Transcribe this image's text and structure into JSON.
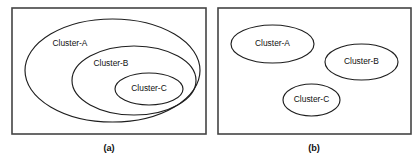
{
  "figure": {
    "background_color": "#ffffff",
    "frame_color": "#444444",
    "ellipse_color": "#1e1e1e",
    "text_color": "#111111",
    "panels": [
      {
        "id": "panel-a",
        "caption": "(a)",
        "caption_x": 109,
        "caption_y": 149,
        "frame": {
          "x": 12,
          "y": 8,
          "width": 194,
          "height": 126
        },
        "clusters": [
          {
            "label": "Cluster-A",
            "cx": 112.5,
            "cy": 70.5,
            "rx": 87.5,
            "ry": 51.5,
            "label_x": 70,
            "label_y": 44
          },
          {
            "label": "Cluster-B",
            "cx": 134,
            "cy": 80.5,
            "rx": 62,
            "ry": 34.5,
            "label_x": 111,
            "label_y": 64
          },
          {
            "label": "Cluster-C",
            "cx": 149,
            "cy": 89,
            "rx": 34,
            "ry": 16,
            "label_x": 149,
            "label_y": 89
          }
        ]
      },
      {
        "id": "panel-b",
        "caption": "(b)",
        "caption_x": 314,
        "caption_y": 149,
        "frame": {
          "x": 218,
          "y": 8,
          "width": 193,
          "height": 126
        },
        "clusters": [
          {
            "label": "Cluster-A",
            "cx": 272.5,
            "cy": 44,
            "rx": 41.5,
            "ry": 19,
            "label_x": 272.5,
            "label_y": 44
          },
          {
            "label": "Cluster-B",
            "cx": 361.5,
            "cy": 62,
            "rx": 36.5,
            "ry": 18,
            "label_x": 361.5,
            "label_y": 62
          },
          {
            "label": "Cluster-C",
            "cx": 311.5,
            "cy": 100,
            "rx": 28.5,
            "ry": 16,
            "label_x": 311.5,
            "label_y": 100
          }
        ]
      }
    ]
  }
}
